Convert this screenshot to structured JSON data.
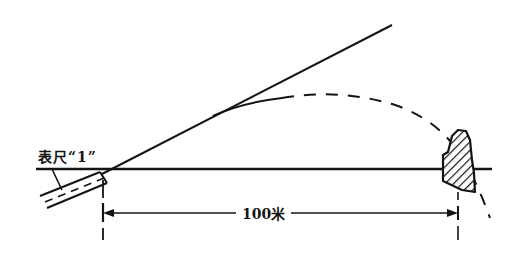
{
  "diagram": {
    "type": "trajectory-range-diagram",
    "gauge_label": "表尺“1”",
    "distance_label": "100米",
    "elements": [
      {
        "name": "ground-line",
        "kind": "solid"
      },
      {
        "name": "line-of-sight",
        "kind": "solid"
      },
      {
        "name": "barrel",
        "kind": "double-line-with-dashed-axis"
      },
      {
        "name": "trajectory",
        "kind": "dashed-curve"
      },
      {
        "name": "target",
        "kind": "hatched-shape"
      },
      {
        "name": "distance-dimension",
        "kind": "arrowed-dimension",
        "value": "100米"
      }
    ],
    "colors": {
      "ink": "#141414",
      "background": "#ffffff"
    }
  }
}
